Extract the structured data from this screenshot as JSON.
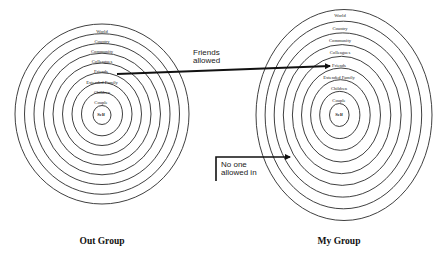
{
  "diagram": {
    "rings": [
      "Self",
      "Couple",
      "Children",
      "Extended Family",
      "Friends",
      "Colleagues",
      "Community",
      "Country",
      "World"
    ],
    "groups": [
      {
        "id": "out",
        "caption": "Out Group"
      },
      {
        "id": "my",
        "caption": "My Group"
      }
    ],
    "annotations": {
      "friends_allowed": {
        "line1": "Friends",
        "line2": "allowed"
      },
      "no_one_allowed": {
        "line1": "No one",
        "line2": "allowed in"
      }
    },
    "colors": {
      "stroke": "#2a2a2a",
      "background": "#ffffff"
    }
  }
}
